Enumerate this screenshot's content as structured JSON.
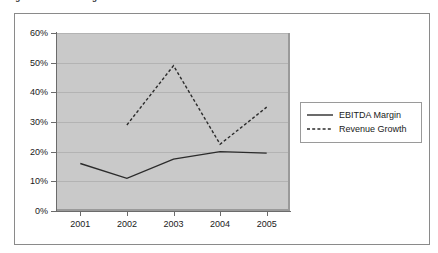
{
  "figure": {
    "caption": "Figure 1: EBITDA Margin and Revenue Growth",
    "frame_color": "#8a8a8a",
    "plot_background": "#c9c9c9",
    "gridline_color": "#b3b3b3",
    "axis_color": "#6b6b6b"
  },
  "legend": {
    "position": "right",
    "entries": [
      {
        "label": "EBITDA Margin",
        "style": "solid",
        "color": "#2b2b2b"
      },
      {
        "label": "Revenue Growth",
        "style": "dashed",
        "color": "#2b2b2b"
      }
    ]
  },
  "chart_data": {
    "type": "line",
    "title": "Figure 1: EBITDA Margin and Revenue Growth",
    "xlabel": "",
    "ylabel": "",
    "categories": [
      "2001",
      "2002",
      "2003",
      "2004",
      "2005"
    ],
    "x_tick_labels": [
      "2001",
      "2002",
      "2003",
      "2004",
      "2005"
    ],
    "y_tick_labels": [
      "0%",
      "10%",
      "20%",
      "30%",
      "40%",
      "50%",
      "60%"
    ],
    "y_tick_values": [
      0,
      10,
      20,
      30,
      40,
      50,
      60
    ],
    "ylim": [
      0,
      60
    ],
    "grid": true,
    "legend_position": "right",
    "series": [
      {
        "name": "EBITDA Margin",
        "style": "solid",
        "color": "#2b2b2b",
        "x": [
          "2001",
          "2002",
          "2003",
          "2004",
          "2005"
        ],
        "values": [
          16,
          11,
          17.5,
          20,
          19.5
        ]
      },
      {
        "name": "Revenue Growth",
        "style": "dashed",
        "color": "#2b2b2b",
        "x": [
          "2002",
          "2003",
          "2004",
          "2005"
        ],
        "values": [
          29,
          49,
          22.5,
          35
        ]
      }
    ]
  }
}
